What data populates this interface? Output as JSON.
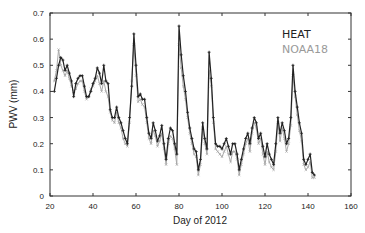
{
  "chart_data": {
    "type": "line",
    "title": "",
    "xlabel": "Day of 2012",
    "ylabel": "PWV (mm)",
    "xlim": [
      20,
      160
    ],
    "ylim": [
      0,
      0.7
    ],
    "xticks": [
      20,
      40,
      60,
      80,
      100,
      120,
      140,
      160
    ],
    "yticks": [
      0,
      0.1,
      0.2,
      0.3,
      0.4,
      0.5,
      0.6,
      0.7
    ],
    "grid": false,
    "legend_position": "upper right",
    "series": [
      {
        "name": "HEAT",
        "color": "#222222",
        "x": [
          22,
          23,
          24,
          25,
          26,
          27,
          28,
          29,
          30,
          31,
          32,
          33,
          34,
          35,
          36,
          37,
          38,
          39,
          40,
          41,
          42,
          43,
          44,
          45,
          46,
          47,
          48,
          49,
          50,
          51,
          52,
          53,
          54,
          55,
          56,
          57,
          58,
          59,
          60,
          61,
          62,
          63,
          64,
          65,
          66,
          67,
          68,
          69,
          70,
          71,
          72,
          73,
          74,
          75,
          76,
          77,
          78,
          79,
          80,
          81,
          82,
          83,
          84,
          85,
          86,
          87,
          88,
          89,
          90,
          91,
          92,
          93,
          94,
          95,
          96,
          97,
          98,
          99,
          100,
          101,
          102,
          103,
          104,
          105,
          106,
          107,
          108,
          109,
          110,
          111,
          112,
          113,
          114,
          115,
          116,
          117,
          118,
          119,
          120,
          121,
          122,
          123,
          124,
          125,
          126,
          127,
          128,
          129,
          130,
          131,
          132,
          133,
          134,
          135,
          136,
          137,
          138,
          139,
          140,
          141,
          142,
          143
        ],
        "values": [
          0.4,
          0.45,
          0.5,
          0.53,
          0.52,
          0.48,
          0.5,
          0.47,
          0.44,
          0.38,
          0.43,
          0.45,
          0.46,
          0.46,
          0.42,
          0.38,
          0.38,
          0.4,
          0.43,
          0.45,
          0.49,
          0.47,
          0.43,
          0.5,
          0.44,
          0.43,
          0.33,
          0.3,
          0.3,
          0.34,
          0.3,
          0.28,
          0.25,
          0.22,
          0.2,
          0.3,
          0.42,
          0.62,
          0.5,
          0.38,
          0.39,
          0.37,
          0.37,
          0.3,
          0.24,
          0.22,
          0.28,
          0.25,
          0.21,
          0.23,
          0.27,
          0.2,
          0.14,
          0.22,
          0.26,
          0.25,
          0.2,
          0.16,
          0.65,
          0.54,
          0.46,
          0.4,
          0.32,
          0.26,
          0.22,
          0.18,
          0.17,
          0.1,
          0.14,
          0.28,
          0.22,
          0.18,
          0.55,
          0.45,
          0.3,
          0.2,
          0.19,
          0.19,
          0.18,
          0.2,
          0.22,
          0.19,
          0.16,
          0.2,
          0.2,
          0.16,
          0.1,
          0.14,
          0.18,
          0.22,
          0.24,
          0.2,
          0.26,
          0.3,
          0.28,
          0.22,
          0.24,
          0.19,
          0.15,
          0.2,
          0.16,
          0.14,
          0.12,
          0.2,
          0.3,
          0.24,
          0.28,
          0.25,
          0.2,
          0.22,
          0.3,
          0.5,
          0.4,
          0.34,
          0.28,
          0.24,
          0.14,
          0.12,
          0.14,
          0.16,
          0.09,
          0.08
        ],
        "marker": "+"
      },
      {
        "name": "NOAA18",
        "color": "#a8a8a8",
        "x": [
          22,
          23,
          24,
          25,
          26,
          27,
          28,
          29,
          30,
          31,
          32,
          33,
          34,
          35,
          36,
          37,
          38,
          39,
          40,
          41,
          42,
          43,
          44,
          45,
          46,
          47,
          48,
          49,
          50,
          51,
          52,
          53,
          54,
          55,
          56,
          57,
          58,
          59,
          60,
          61,
          62,
          63,
          64,
          65,
          66,
          67,
          68,
          69,
          70,
          71,
          72,
          73,
          74,
          75,
          76,
          77,
          78,
          79,
          80,
          81,
          82,
          83,
          84,
          85,
          86,
          87,
          88,
          89,
          90,
          91,
          92,
          93,
          94,
          95,
          96,
          97,
          98,
          99,
          100,
          101,
          102,
          103,
          104,
          105,
          106,
          107,
          108,
          109,
          110,
          111,
          112,
          113,
          114,
          115,
          116,
          117,
          118,
          119,
          120,
          121,
          122,
          123,
          124,
          125,
          126,
          127,
          128,
          129,
          130,
          131,
          132,
          133,
          134,
          135,
          136,
          137,
          138,
          139,
          140,
          141,
          142,
          143
        ],
        "values": [
          0.44,
          0.48,
          0.56,
          0.5,
          0.48,
          0.46,
          0.48,
          0.45,
          0.42,
          0.4,
          0.41,
          0.43,
          0.44,
          0.44,
          0.4,
          0.37,
          0.38,
          0.41,
          0.42,
          0.44,
          0.46,
          0.43,
          0.4,
          0.44,
          0.4,
          0.38,
          0.32,
          0.29,
          0.28,
          0.32,
          0.28,
          0.26,
          0.22,
          0.2,
          0.19,
          0.28,
          0.44,
          0.58,
          0.46,
          0.36,
          0.37,
          0.35,
          0.34,
          0.28,
          0.22,
          0.2,
          0.25,
          0.23,
          0.19,
          0.21,
          0.24,
          0.18,
          0.12,
          0.2,
          0.23,
          0.22,
          0.18,
          0.12,
          0.58,
          0.49,
          0.42,
          0.37,
          0.3,
          0.24,
          0.2,
          0.16,
          0.15,
          0.08,
          0.12,
          0.26,
          0.2,
          0.16,
          0.48,
          0.42,
          0.28,
          0.18,
          0.17,
          0.16,
          0.15,
          0.17,
          0.19,
          0.16,
          0.13,
          0.17,
          0.17,
          0.14,
          0.08,
          0.12,
          0.16,
          0.2,
          0.22,
          0.17,
          0.24,
          0.28,
          0.26,
          0.2,
          0.22,
          0.16,
          0.12,
          0.17,
          0.13,
          0.11,
          0.1,
          0.17,
          0.28,
          0.21,
          0.26,
          0.22,
          0.17,
          0.2,
          0.27,
          0.46,
          0.38,
          0.31,
          0.25,
          0.21,
          0.12,
          0.1,
          0.11,
          0.13,
          0.07,
          0.07
        ],
        "marker": "x"
      }
    ]
  },
  "legend": {
    "items": [
      {
        "label": "HEAT"
      },
      {
        "label": "NOAA18"
      }
    ]
  },
  "axes": {
    "xlabel": "Day of 2012",
    "ylabel": "PWV (mm)"
  }
}
